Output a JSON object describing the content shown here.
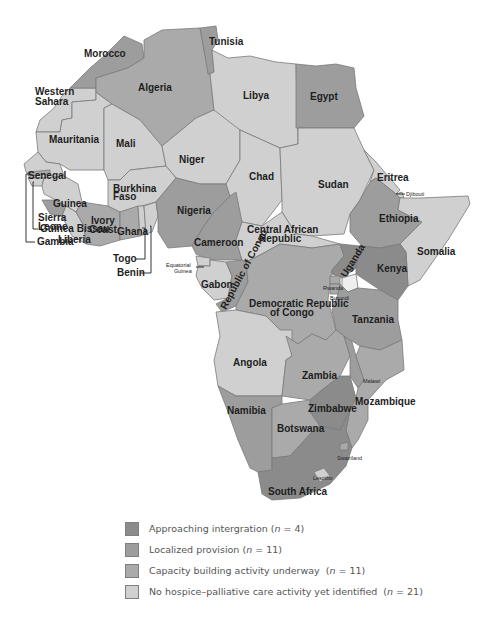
{
  "map": {
    "title": "Hospice-palliative care development in Africa",
    "categories": {
      "approaching": {
        "label": "Approaching intergration",
        "n": "4",
        "color": "#8b8b8b"
      },
      "localized": {
        "label": "Localized provision",
        "n": "11",
        "color": "#9d9d9d"
      },
      "capacity": {
        "label": "Capacity building activity underway",
        "n": "11",
        "color": "#aaaaaa"
      },
      "none": {
        "label": "No hospice–palliative care activity yet identified",
        "n": "21",
        "color": "#d0d0d0"
      }
    },
    "countries": {
      "morocco": {
        "name": "Morocco",
        "category": "localized"
      },
      "tunisia": {
        "name": "Tunisia",
        "category": "localized"
      },
      "algeria": {
        "name": "Algeria",
        "category": "capacity"
      },
      "western_sahara": {
        "name": "Western\nSahara",
        "category": "none"
      },
      "libya": {
        "name": "Libya",
        "category": "none"
      },
      "egypt": {
        "name": "Egypt",
        "category": "localized"
      },
      "mauritania": {
        "name": "Mauritania",
        "category": "none"
      },
      "mali": {
        "name": "Mali",
        "category": "none"
      },
      "niger": {
        "name": "Niger",
        "category": "none"
      },
      "chad": {
        "name": "Chad",
        "category": "none"
      },
      "sudan": {
        "name": "Sudan",
        "category": "none"
      },
      "eritrea": {
        "name": "Eritrea",
        "category": "none"
      },
      "djibouti": {
        "name": "Djibouti",
        "category": "none"
      },
      "senegal": {
        "name": "Senegal",
        "category": "none"
      },
      "gambia": {
        "name": "Gambia",
        "category": "capacity"
      },
      "guinea_bissau": {
        "name": "Guinea Bissau",
        "category": "none"
      },
      "guinea": {
        "name": "Guinea",
        "category": "none"
      },
      "sierra_leone": {
        "name": "Sierra\nLeone",
        "category": "localized"
      },
      "liberia": {
        "name": "Liberia",
        "category": "none"
      },
      "ivory_coast": {
        "name": "Ivory\nCoast",
        "category": "capacity"
      },
      "burkina_faso": {
        "name": "Burkhina\nFaso",
        "category": "none"
      },
      "ghana": {
        "name": "Ghana",
        "category": "capacity"
      },
      "togo": {
        "name": "Togo",
        "category": "none"
      },
      "benin": {
        "name": "Benin",
        "category": "none"
      },
      "nigeria": {
        "name": "Nigeria",
        "category": "localized"
      },
      "cameroon": {
        "name": "Cameroon",
        "category": "localized"
      },
      "central_african_republic": {
        "name": "Central African\nRepublic",
        "category": "none"
      },
      "ethiopia": {
        "name": "Ethiopia",
        "category": "localized"
      },
      "somalia": {
        "name": "Somalia",
        "category": "none"
      },
      "equatorial_guinea": {
        "name": "Equatorial\nGuinea",
        "category": "none"
      },
      "gabon": {
        "name": "Gabon",
        "category": "none"
      },
      "republic_of_congo": {
        "name": "Republic of Congo",
        "category": "localized"
      },
      "drc": {
        "name": "Democratic Republic\nof Congo",
        "category": "capacity"
      },
      "uganda": {
        "name": "Uganda",
        "category": "approaching"
      },
      "kenya": {
        "name": "Kenya",
        "category": "approaching"
      },
      "rwanda": {
        "name": "Rwanda",
        "category": "capacity"
      },
      "burundi": {
        "name": "Burundi",
        "category": "capacity"
      },
      "tanzania": {
        "name": "Tanzania",
        "category": "localized"
      },
      "angola": {
        "name": "Angola",
        "category": "none"
      },
      "zambia": {
        "name": "Zambia",
        "category": "capacity"
      },
      "malawi": {
        "name": "Malawi",
        "category": "localized"
      },
      "mozambique": {
        "name": "Mozambique",
        "category": "capacity"
      },
      "zimbabwe": {
        "name": "Zimbabwe",
        "category": "approaching"
      },
      "namibia": {
        "name": "Namibia",
        "category": "localized"
      },
      "botswana": {
        "name": "Botswana",
        "category": "capacity"
      },
      "swaziland": {
        "name": "Swaziland",
        "category": "capacity"
      },
      "lesotho": {
        "name": "Lesotho",
        "category": "none"
      },
      "south_africa": {
        "name": "South Africa",
        "category": "approaching"
      }
    }
  },
  "legend": {
    "items": [
      {
        "label": "Approaching intergration",
        "n_prefix": "(",
        "n_var": "n",
        "n_value": " = 4)",
        "color": "#8b8b8b"
      },
      {
        "label": "Localized provision",
        "n_prefix": "(",
        "n_var": "n",
        "n_value": " = 11)",
        "color": "#9d9d9d"
      },
      {
        "label": "Capacity building activity underway  ",
        "n_prefix": "(",
        "n_var": "n",
        "n_value": " = 11)",
        "color": "#aaaaaa"
      },
      {
        "label": "No hospice–palliative care activity yet identified  ",
        "n_prefix": "(",
        "n_var": "n",
        "n_value": " = 21)",
        "color": "#d0d0d0"
      }
    ]
  }
}
